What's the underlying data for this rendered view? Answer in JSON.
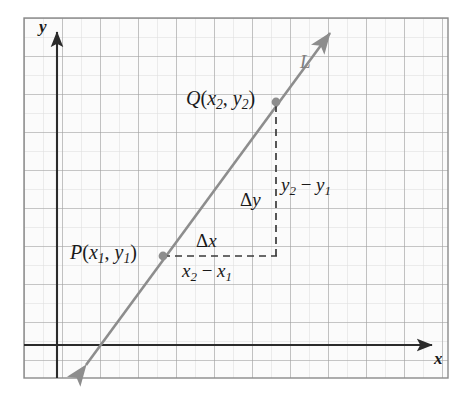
{
  "figure": {
    "kind": "coordinate-grid-slope-diagram",
    "background_color": "#ffffff",
    "frame_color": "#8a8a8a",
    "grid_major_color": "#9a9a9a",
    "grid_minor_color": "#d8d8d8",
    "axis_color": "#2b2b2b",
    "line_color": "#8d8d8d",
    "point_color": "#8d8d8d",
    "dash_color": "#3a3a3a",
    "text_color": "#1a1a1a"
  },
  "axes": {
    "x_axis_label": "x",
    "y_axis_label": "y",
    "x_axis_y_px": 345,
    "y_axis_x_px": 57,
    "x_arrow_tip_px": [
      437,
      345
    ],
    "y_arrow_tip_px": [
      57,
      26
    ]
  },
  "line": {
    "name": "L",
    "label": "L",
    "start_px": [
      82,
      370
    ],
    "end_px": [
      333,
      28
    ],
    "slope_visual": -1.363,
    "arrowheads": "both"
  },
  "points": [
    {
      "name": "P",
      "label_prefix": "P",
      "label_full": "P(x1, y1)",
      "coord_x": "x",
      "coord_x_sub": "1",
      "coord_y": "y",
      "coord_y_sub": "1",
      "px": [
        163,
        256
      ]
    },
    {
      "name": "Q",
      "label_prefix": "Q",
      "label_full": "Q(x2, y2)",
      "coord_x": "x",
      "coord_x_sub": "2",
      "coord_y": "y",
      "coord_y_sub": "2",
      "px": [
        276,
        102
      ]
    }
  ],
  "annotations": {
    "delta_x": {
      "symbol": "Δ",
      "variable": "x",
      "text": "Δx",
      "px": [
        214,
        242
      ]
    },
    "delta_y": {
      "symbol": "Δ",
      "variable": "y",
      "text": "Δy",
      "px": [
        253,
        200
      ]
    },
    "run": {
      "text": "x2 - x1",
      "first_var": "x",
      "first_sub": "2",
      "minus": "−",
      "second_var": "x",
      "second_sub": "1",
      "px": [
        214,
        272
      ]
    },
    "rise": {
      "text": "y2 - y1",
      "first_var": "y",
      "first_sub": "2",
      "minus": "−",
      "second_var": "y",
      "second_sub": "1",
      "px": [
        288,
        186
      ]
    },
    "line_label": {
      "text": "L",
      "px": [
        304,
        62
      ]
    }
  },
  "dashed_segments": [
    {
      "name": "run-segment",
      "from_px": [
        163,
        256
      ],
      "to_px": [
        276,
        256
      ]
    },
    {
      "name": "rise-segment",
      "from_px": [
        276,
        102
      ],
      "to_px": [
        276,
        256
      ]
    }
  ],
  "grid": {
    "frame_px": {
      "left": 24,
      "top": 18,
      "right": 448,
      "bottom": 378
    },
    "major_spacing_px": 38,
    "minor_per_major": 2
  }
}
